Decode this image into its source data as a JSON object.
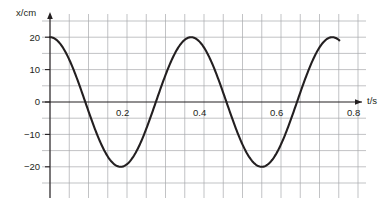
{
  "figure": {
    "axis_label_y": "x/cm",
    "axis_label_x": "t/s",
    "axis_label_y_italic_part": "x",
    "axis_label_x_italic_part": "t",
    "colors": {
      "curve": "#231f20",
      "axis": "#231f20",
      "grid": "#a7a9ac",
      "background": "#ffffff",
      "text": "#231f20"
    }
  },
  "y_ticks": [
    {
      "label": "20",
      "value": 20
    },
    {
      "label": "10",
      "value": 10
    },
    {
      "label": "0",
      "value": 0
    },
    {
      "label": "−10",
      "value": -10
    },
    {
      "label": "−20",
      "value": -20
    }
  ],
  "x_ticks": [
    {
      "label": "0.2",
      "value": 0.2
    },
    {
      "label": "0.4",
      "value": 0.4
    },
    {
      "label": "0.6",
      "value": 0.6
    },
    {
      "label": "0.8",
      "value": 0.8
    }
  ],
  "chart_data": {
    "type": "line",
    "title": "",
    "xlabel": "t/s",
    "ylabel": "x/cm",
    "xlim": [
      0,
      0.875
    ],
    "ylim": [
      -25,
      25
    ],
    "grid": true,
    "grid_spacing_x": 0.05,
    "grid_spacing_y": 5,
    "legend": null,
    "function": "x = 20 cos(2πt / 0.4)",
    "amplitude_cm": 20,
    "period_s": 0.4,
    "series": [
      {
        "name": "displacement",
        "x": [
          0,
          0.02,
          0.04,
          0.06,
          0.08,
          0.1,
          0.12,
          0.14,
          0.16,
          0.18,
          0.2,
          0.22,
          0.24,
          0.26,
          0.28,
          0.3,
          0.32,
          0.34,
          0.36,
          0.38,
          0.4,
          0.42,
          0.44,
          0.46,
          0.48,
          0.5,
          0.52,
          0.54,
          0.56,
          0.58,
          0.6,
          0.62,
          0.64,
          0.66,
          0.68,
          0.7,
          0.72,
          0.74,
          0.76,
          0.78,
          0.8
        ],
        "y": [
          20,
          19.02,
          16.18,
          11.76,
          6.18,
          0,
          -6.18,
          -11.76,
          -16.18,
          -19.02,
          -20,
          -19.02,
          -16.18,
          -11.76,
          -6.18,
          0,
          6.18,
          11.76,
          16.18,
          19.02,
          20,
          19.02,
          16.18,
          11.76,
          6.18,
          0,
          -6.18,
          -11.76,
          -16.18,
          -19.02,
          -20,
          -19.02,
          -16.18,
          -11.76,
          -6.18,
          0,
          6.18,
          11.76,
          16.18,
          19.02,
          20
        ]
      }
    ],
    "zero_crossings": [
      0.1,
      0.3,
      0.5,
      0.7
    ],
    "maxima": [
      {
        "t": 0,
        "x": 20
      },
      {
        "t": 0.4,
        "x": 20
      },
      {
        "t": 0.8,
        "x": 20
      }
    ],
    "minima": [
      {
        "t": 0.2,
        "x": -20
      },
      {
        "t": 0.6,
        "x": -20
      }
    ]
  }
}
